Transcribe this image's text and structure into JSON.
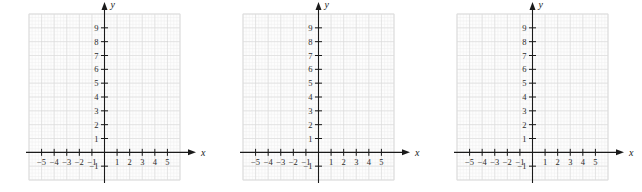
{
  "figure": {
    "panel_count": 3,
    "background_color": "#ffffff"
  },
  "chart_data": {
    "type": "scatter",
    "title": "",
    "subtitle": "",
    "xlabel": "x",
    "ylabel": "y",
    "xlim": [
      -6,
      6
    ],
    "ylim": [
      -2,
      10
    ],
    "xticks": [
      -5,
      -4,
      -3,
      -2,
      -1,
      1,
      2,
      3,
      4,
      5
    ],
    "yticks": [
      -1,
      1,
      2,
      3,
      4,
      5,
      6,
      7,
      8,
      9
    ],
    "xtick_labels": [
      "−5",
      "−4",
      "−3",
      "−2",
      "−1",
      "1",
      "2",
      "3",
      "4",
      "5"
    ],
    "ytick_labels": [
      "−1",
      "1",
      "2",
      "3",
      "4",
      "5",
      "6",
      "7",
      "8",
      "9"
    ],
    "grid": true,
    "minor_grid": true,
    "minor_subdivisions": 4,
    "legend": "none",
    "series": [
      {
        "name": "panel-1",
        "x": [],
        "y": []
      },
      {
        "name": "panel-2",
        "x": [],
        "y": []
      },
      {
        "name": "panel-3",
        "x": [],
        "y": []
      }
    ],
    "annotations": []
  },
  "style": {
    "axis_color": "#1a1a1a",
    "major_grid_color": "#dcdcdc",
    "minor_grid_color": "#eeeeee",
    "tick_label_color": "#2b2b2b",
    "plot_background": "#fdfdfd"
  },
  "panels": [
    {
      "id": "panel-1",
      "label": "",
      "x_axis_name": "x",
      "y_axis_name": "y"
    },
    {
      "id": "panel-2",
      "label": "",
      "x_axis_name": "x",
      "y_axis_name": "y"
    },
    {
      "id": "panel-3",
      "label": "",
      "x_axis_name": "x",
      "y_axis_name": "y"
    }
  ]
}
